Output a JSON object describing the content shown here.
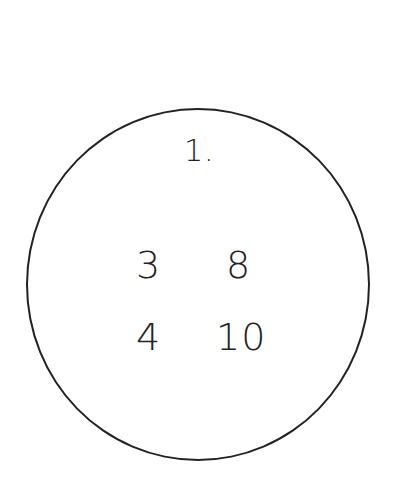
{
  "diagram": {
    "shape": "circle",
    "stroke_color": "#222222",
    "title": "1.",
    "numbers": [
      "3",
      "8",
      "4",
      "10"
    ],
    "grid": [
      [
        "3",
        "8"
      ],
      [
        "4",
        "10"
      ]
    ]
  }
}
